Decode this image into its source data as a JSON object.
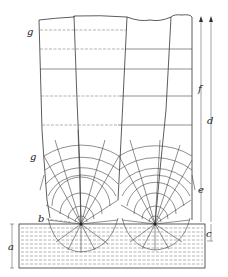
{
  "figure": {
    "type": "schematic",
    "labels": {
      "a": "a",
      "b": "b",
      "c": "c",
      "d": "d",
      "e": "e",
      "f": "f",
      "g_top": "g",
      "g_mid": "g"
    },
    "nuclei": [
      {
        "x": 81,
        "y": 224
      },
      {
        "x": 155,
        "y": 224
      }
    ],
    "horizontal_growth_lines_y": [
      30,
      49,
      69,
      96,
      125
    ],
    "colors": {
      "line": "#333333",
      "background": "#ffffff"
    }
  }
}
